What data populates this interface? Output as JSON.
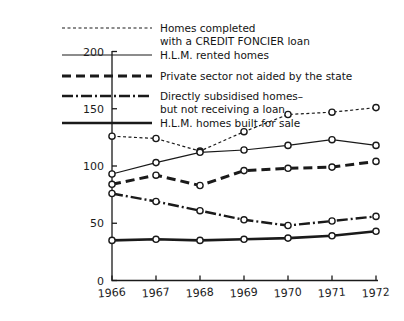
{
  "figure": {
    "background": "#ffffff",
    "ink": "#1a1a1a"
  },
  "chart_data": {
    "type": "line",
    "title": "",
    "xlabel": "",
    "ylabel": "",
    "categories": [
      "1966",
      "1967",
      "1968",
      "1969",
      "1970",
      "1971",
      "1972"
    ],
    "x": [
      1966,
      1967,
      1968,
      1969,
      1970,
      1971,
      1972
    ],
    "xlim": [
      1966,
      1972
    ],
    "ylim": [
      0,
      200
    ],
    "yticks": [
      0,
      50,
      100,
      150,
      200
    ],
    "ytick_labels": [
      "0",
      "50",
      "100",
      "150",
      "200"
    ],
    "xticks": [
      1966,
      1967,
      1968,
      1969,
      1970,
      1971,
      1972
    ],
    "grid": false,
    "legend_position": "top-left-inside",
    "markers": "open-circle",
    "series": [
      {
        "name": "Homes completed with a CREDIT FONCIER loan",
        "label_lines": [
          "Homes completed",
          "with a CREDIT FONCIER loan"
        ],
        "style": "fine-dotted",
        "dash": "3,2.5",
        "width": 1.2,
        "color": "#1a1a1a",
        "values": [
          126,
          124,
          113,
          130,
          145,
          147,
          151
        ]
      },
      {
        "name": "H.L.M. rented homes",
        "label_lines": [
          "H.L.M. rented homes"
        ],
        "style": "thin-solid",
        "dash": "",
        "width": 1.2,
        "color": "#1a1a1a",
        "values": [
          93,
          103,
          112,
          114,
          118,
          123,
          118
        ]
      },
      {
        "name": "Private sector not aided by the state",
        "label_lines": [
          "Private sector not aided by the state"
        ],
        "style": "bold-dashed",
        "dash": "9,5",
        "width": 3.0,
        "color": "#1a1a1a",
        "values": [
          84,
          92,
          83,
          96,
          98,
          99,
          104
        ]
      },
      {
        "name": "Directly subsidised homes- but not receiving a loan",
        "label_lines": [
          "Directly subsidised homes–",
          "but not receiving a loan"
        ],
        "style": "dash-dot",
        "dash": "11,3,2,3",
        "width": 2.4,
        "color": "#1a1a1a",
        "values": [
          76,
          69,
          61,
          53,
          48,
          52,
          56
        ]
      },
      {
        "name": "H.L.M. homes built for sale",
        "label_lines": [
          "H.L.M. homes built for sale"
        ],
        "style": "bold-solid",
        "dash": "",
        "width": 2.6,
        "color": "#1a1a1a",
        "values": [
          35,
          36,
          35,
          36,
          37,
          39,
          43
        ]
      }
    ]
  },
  "legend": {
    "entries": [
      {
        "swatch": "fine-dotted",
        "lines": [
          "Homes completed",
          "with a CREDIT FONCIER loan"
        ]
      },
      {
        "swatch": "thin-solid",
        "lines": [
          "H.L.M. rented homes"
        ]
      },
      {
        "swatch": "bold-dashed",
        "lines": [
          "Private sector not aided by the state"
        ]
      },
      {
        "swatch": "dash-dot",
        "lines": [
          "Directly subsidised homes–",
          "but not receiving a loan"
        ]
      },
      {
        "swatch": "bold-solid",
        "lines": [
          "H.L.M. homes built for sale"
        ]
      }
    ]
  }
}
